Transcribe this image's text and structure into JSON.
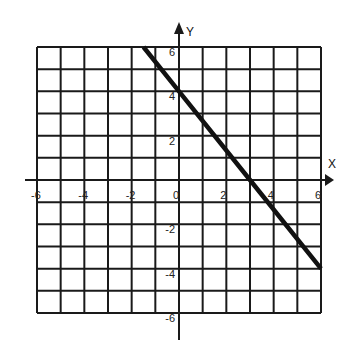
{
  "chart_data": {
    "type": "line",
    "title": "",
    "xlabel": "X",
    "ylabel": "Y",
    "xlim": [
      -6,
      6
    ],
    "ylim": [
      -6,
      6
    ],
    "grid": true,
    "grid_step": 1,
    "x_tick_labels": [
      "-6",
      "-4",
      "-2",
      "0",
      "2",
      "4",
      "6"
    ],
    "x_tick_values": [
      -6,
      -4,
      -2,
      0,
      2,
      4,
      6
    ],
    "y_tick_labels": [
      "6",
      "4",
      "2",
      "-2",
      "-4",
      "-6"
    ],
    "y_tick_values": [
      6,
      4,
      2,
      -2,
      -4,
      -6
    ],
    "series": [
      {
        "name": "line",
        "equation": "y = -4/3 x + 4",
        "x": [
          -1.5,
          0,
          3,
          6
        ],
        "y": [
          6,
          4,
          0,
          -4
        ]
      }
    ],
    "legend": null
  },
  "colors": {
    "grid": "#1a1a1a",
    "line": "#111111",
    "background": "#ffffff"
  }
}
